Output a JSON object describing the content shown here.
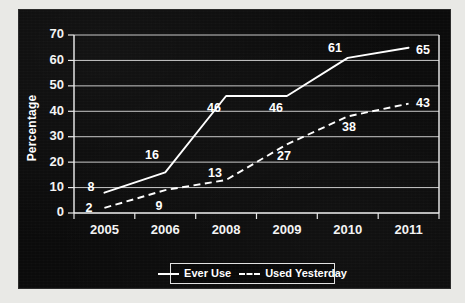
{
  "chart_data": {
    "type": "line",
    "title": "",
    "subtitle": "",
    "xlabel": "",
    "ylabel": "Percentage",
    "categories": [
      "2005",
      "2006",
      "2008",
      "2009",
      "2010",
      "2011"
    ],
    "ylim": [
      0,
      70
    ],
    "yticks": [
      0,
      10,
      20,
      30,
      40,
      50,
      60,
      70
    ],
    "grid": "horizontal",
    "legend_position": "bottom",
    "series": [
      {
        "name": "Ever Use",
        "style": "solid",
        "color": "#ffffff",
        "values": [
          8,
          16,
          46,
          46,
          61,
          65
        ],
        "labels": [
          "8",
          "16",
          "46",
          "46",
          "61",
          "65"
        ]
      },
      {
        "name": "Used Yesterday",
        "style": "dashed",
        "color": "#ffffff",
        "values": [
          2,
          9,
          13,
          27,
          38,
          43
        ],
        "labels": [
          "2",
          "9",
          "13",
          "27",
          "38",
          "43"
        ]
      }
    ]
  },
  "axes": {
    "y_label": "Percentage",
    "y_tick_labels": [
      "0",
      "10",
      "20",
      "30",
      "40",
      "50",
      "60",
      "70"
    ],
    "x_tick_labels": [
      "2005",
      "2006",
      "2008",
      "2009",
      "2010",
      "2011"
    ]
  },
  "legend": {
    "items": [
      {
        "label": "Ever Use",
        "style": "solid"
      },
      {
        "label": "Used Yesterday",
        "style": "dashed"
      }
    ]
  },
  "point_labels": {
    "ever_use": [
      "8",
      "16",
      "46",
      "46",
      "61",
      "65"
    ],
    "used_yesterday": [
      "2",
      "9",
      "13",
      "27",
      "38",
      "43"
    ]
  },
  "colors": {
    "plate_background": "#0b0b0b",
    "series_line": "#ffffff",
    "grid": "#d8d8d8",
    "text": "#ffffff",
    "page_border": "#e9e9e6"
  }
}
